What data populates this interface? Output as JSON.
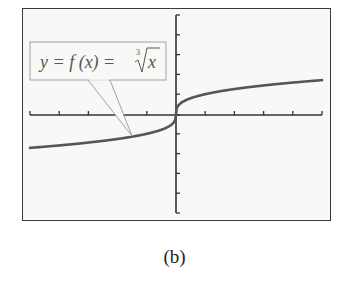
{
  "figure": {
    "caption": "(b)",
    "callout": {
      "lhs": "y = f (x) = ",
      "root_index": "3",
      "radicand": "x"
    }
  },
  "colors": {
    "frame": "#3a3a3a",
    "background": "#f8f8f6",
    "axis": "#333333",
    "curve": "#555555",
    "callout_border": "#999999"
  },
  "chart_data": {
    "type": "line",
    "title": "",
    "function": "y = cbrt(x)",
    "xlabel": "",
    "ylabel": "",
    "xlim": [
      -5,
      5
    ],
    "ylim": [
      -5,
      5
    ],
    "x_ticks": [
      -5,
      -4,
      -3,
      -2,
      -1,
      0,
      1,
      2,
      3,
      4,
      5
    ],
    "y_ticks": [
      -5,
      -4,
      -3,
      -2,
      -1,
      0,
      1,
      2,
      3,
      4,
      5
    ],
    "tick_labels_shown": false,
    "grid": false,
    "legend": "none",
    "annotations": [
      "y = f(x) = ∛x (callout pointing to curve at approx x = -1.5)"
    ],
    "series": [
      {
        "name": "y = ∛x",
        "x": [
          -5,
          -4,
          -3,
          -2,
          -1,
          -0.5,
          -0.1,
          0,
          0.1,
          0.5,
          1,
          2,
          3,
          4,
          5
        ],
        "y": [
          -1.71,
          -1.59,
          -1.44,
          -1.26,
          -1.0,
          -0.79,
          -0.46,
          0,
          0.46,
          0.79,
          1.0,
          1.26,
          1.44,
          1.59,
          1.71
        ]
      }
    ]
  }
}
